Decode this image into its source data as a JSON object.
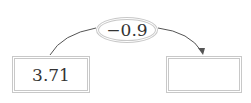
{
  "operation": {
    "label": "−0.9"
  },
  "start_box": {
    "value": "3.71"
  },
  "result_box": {
    "value": ""
  },
  "colors": {
    "border": "#c8c8c8",
    "arrow": "#555555",
    "text": "#333333"
  }
}
